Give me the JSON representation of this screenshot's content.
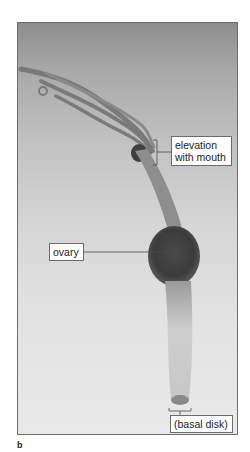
{
  "figure": {
    "panel_letter": "b",
    "labels": {
      "elevation_line1": "elevation",
      "elevation_line2": "with mouth",
      "ovary": "ovary",
      "basal_disk": "(basal disk)"
    },
    "colors": {
      "frame": "#6e6e6e",
      "label_border": "#6b6b6b",
      "leader_line": "#4a4a4a",
      "specimen_dark": "#3a3a3a",
      "specimen_light": "#bdbdbd"
    }
  }
}
